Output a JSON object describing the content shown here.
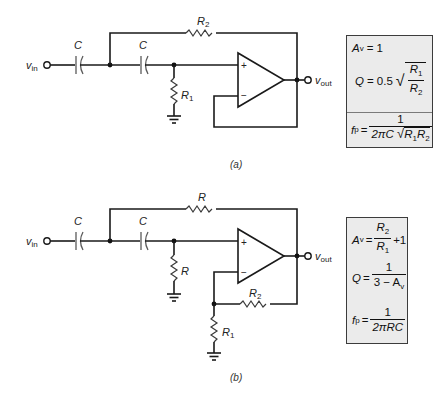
{
  "figure": {
    "panels": [
      {
        "id": "a",
        "caption": "(a)",
        "labels": {
          "input": "v",
          "input_sub": "in",
          "output": "v",
          "output_sub": "out",
          "cap1": "C",
          "cap2": "C",
          "feedback_resistor": "R",
          "feedback_resistor_sub": "2",
          "shunt_resistor": "R",
          "shunt_resistor_sub": "1",
          "plus": "+",
          "minus": "−"
        },
        "equations": {
          "av": {
            "lhs": "A",
            "lhs_sub": "v",
            "rhs": "= 1"
          },
          "q": {
            "lhs": "Q",
            "eq": "= 0.5",
            "num": "R",
            "num_sub": "1",
            "den": "R",
            "den_sub": "2"
          },
          "fp": {
            "lhs": "f",
            "lhs_sub": "p",
            "eq": "=",
            "num": "1",
            "den_prefix": "2πC",
            "den_r1": "R",
            "den_r1_sub": "1",
            "den_r2": "R",
            "den_r2_sub": "2"
          }
        }
      },
      {
        "id": "b",
        "caption": "(b)",
        "labels": {
          "input": "v",
          "input_sub": "in",
          "output": "v",
          "output_sub": "out",
          "cap1": "C",
          "cap2": "C",
          "feedback_resistor": "R",
          "shunt_resistor": "R",
          "gain_r2": "R",
          "gain_r2_sub": "2",
          "gain_r1": "R",
          "gain_r1_sub": "1",
          "plus": "+",
          "minus": "−"
        },
        "equations": {
          "av": {
            "lhs": "A",
            "lhs_sub": "v",
            "eq": "=",
            "num": "R",
            "num_sub": "2",
            "den": "R",
            "den_sub": "1",
            "tail": "+1"
          },
          "q": {
            "lhs": "Q",
            "eq": "=",
            "num": "1",
            "den": "3 − A",
            "den_sub": "v"
          },
          "fp": {
            "lhs": "f",
            "lhs_sub": "p",
            "eq": "=",
            "num": "1",
            "den": "2πRC"
          }
        }
      }
    ],
    "colors": {
      "wire": "#1a1a1a",
      "capacitor": "#5a5a5a",
      "box_fill": "#ebebeb",
      "box_border": "#3c3c3c"
    }
  }
}
